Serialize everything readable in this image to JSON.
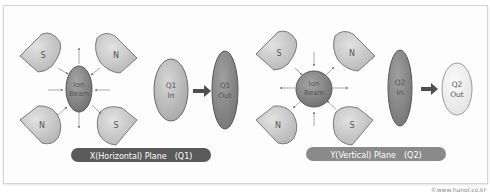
{
  "panels": [
    {
      "id": "x-plane",
      "magnets": [
        {
          "pole": "S",
          "position": "top-left"
        },
        {
          "pole": "N",
          "position": "top-right"
        },
        {
          "pole": "N",
          "position": "bottom-left"
        },
        {
          "pole": "S",
          "position": "bottom-right"
        }
      ],
      "beam": {
        "line1": "Ion",
        "line2": "Beam",
        "shape": "vertical-ellipse"
      },
      "input": {
        "line1": "Q1",
        "line2": "In"
      },
      "output": {
        "line1": "Q1",
        "line2": "Out"
      },
      "caption": "X(Horizontal) Plane　(Q1)"
    },
    {
      "id": "y-plane",
      "magnets": [
        {
          "pole": "S",
          "position": "top-left"
        },
        {
          "pole": "N",
          "position": "top-right"
        },
        {
          "pole": "N",
          "position": "bottom-left"
        },
        {
          "pole": "S",
          "position": "bottom-right"
        }
      ],
      "beam": {
        "line1": "Ion",
        "line2": "Beam",
        "shape": "circle"
      },
      "input": {
        "line1": "Q2",
        "line2": "In"
      },
      "output": {
        "line1": "Q2",
        "line2": "Out"
      },
      "caption": "Y(Vertical) Plane　(Q2)"
    }
  ],
  "colors": {
    "magnet_fill": "#c8c8c8",
    "magnet_stroke": "#7a7a7a",
    "beam_fill": "#8a8a8a",
    "in_q1_fill": "#bdbdbd",
    "out_q1_fill": "#8c8c8c",
    "in_q2_fill": "#8c8c8c",
    "out_q2_fill": "#ececec",
    "caption_q1_bg": "#5a5a5a",
    "caption_q2_bg": "#8a8a8a",
    "arrow": "#555555"
  },
  "copyright": "©www.hanol.co.kr"
}
